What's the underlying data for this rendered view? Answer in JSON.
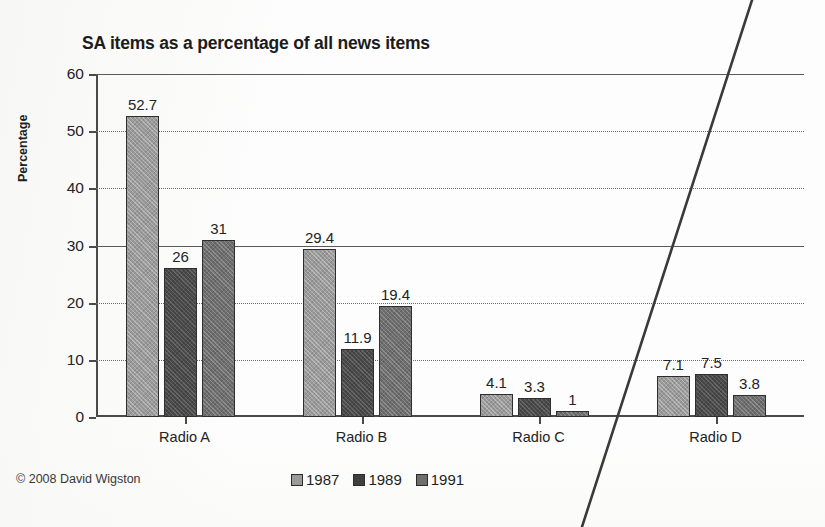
{
  "chart_data": {
    "type": "bar",
    "title": "SA items as a percentage of all news items",
    "xlabel": "",
    "ylabel": "Percentage",
    "categories": [
      "Radio A",
      "Radio B",
      "Radio C",
      "Radio D"
    ],
    "series": [
      {
        "name": "1987",
        "color": "#9a9a9a",
        "values": [
          52.7,
          29.4,
          4.1,
          7.1
        ],
        "labels": [
          "52.7",
          "29.4",
          "4.1",
          "7.1"
        ]
      },
      {
        "name": "1989",
        "color": "#3f3f3f",
        "values": [
          26,
          11.9,
          3.3,
          7.5
        ],
        "labels": [
          "26",
          "11.9",
          "3.3",
          "7.5"
        ]
      },
      {
        "name": "1991",
        "color": "#6e6e6e",
        "values": [
          31,
          19.4,
          1,
          3.8
        ],
        "labels": [
          "31",
          "19.4",
          "1",
          "3.8"
        ]
      }
    ],
    "ylim": [
      0,
      60
    ],
    "yticks": [
      "0",
      "10",
      "20",
      "30",
      "40",
      "50",
      "60"
    ],
    "grid": true,
    "legend_position": "bottom-center"
  },
  "footer": {
    "copyright": "© 2008 David Wigston"
  }
}
